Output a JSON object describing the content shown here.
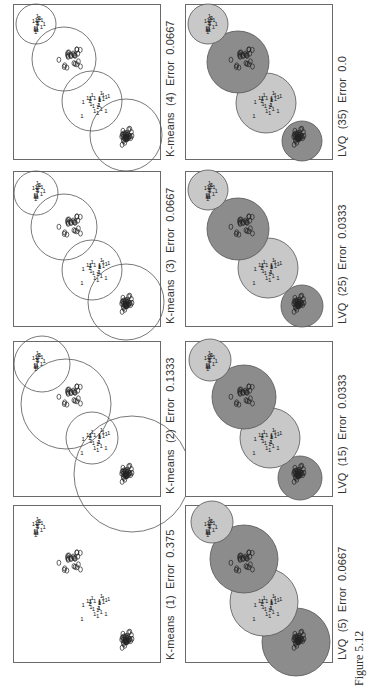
{
  "figure": {
    "label": "Figure 5.12"
  },
  "chart_data": [
    {
      "type": "scatter",
      "title": "K-means (1) Error 0.375",
      "method": "K-means",
      "iterations": 1,
      "error": "0.375",
      "classes": [
        "0",
        "1"
      ],
      "prototype_circles": 0,
      "filled": false
    },
    {
      "type": "scatter",
      "title": "K-means (2) Error 0.1333",
      "method": "K-means",
      "iterations": 2,
      "error": "0.1333",
      "classes": [
        "0",
        "1"
      ],
      "prototype_circles": 4,
      "filled": false
    },
    {
      "type": "scatter",
      "title": "K-means (3) Error 0.0667",
      "method": "K-means",
      "iterations": 3,
      "error": "0.0667",
      "classes": [
        "0",
        "1"
      ],
      "prototype_circles": 4,
      "filled": false
    },
    {
      "type": "scatter",
      "title": "K-means (4) Error 0.0667",
      "method": "K-means",
      "iterations": 4,
      "error": "0.0667",
      "classes": [
        "0",
        "1"
      ],
      "prototype_circles": 4,
      "filled": false
    },
    {
      "type": "scatter",
      "title": "LVQ (5) Error 0.0667",
      "method": "LVQ",
      "iterations": 5,
      "error": "0.0667",
      "classes": [
        "0",
        "1"
      ],
      "prototype_circles": 4,
      "filled": true
    },
    {
      "type": "scatter",
      "title": "LVQ (15) Error 0.0333",
      "method": "LVQ",
      "iterations": 15,
      "error": "0.0333",
      "classes": [
        "0",
        "1"
      ],
      "prototype_circles": 4,
      "filled": true
    },
    {
      "type": "scatter",
      "title": "LVQ (25) Error 0.0333",
      "method": "LVQ",
      "iterations": 25,
      "error": "0.0333",
      "classes": [
        "0",
        "1"
      ],
      "prototype_circles": 4,
      "filled": true
    },
    {
      "type": "scatter",
      "title": "LVQ (35) Error 0.0",
      "method": "LVQ",
      "iterations": 35,
      "error": "0.0",
      "classes": [
        "0",
        "1"
      ],
      "prototype_circles": 4,
      "filled": true
    }
  ],
  "panels": [
    {
      "caption": "K-means  (1)  Error  0.375"
    },
    {
      "caption": "K-means  (2)  Error  0.1333"
    },
    {
      "caption": "K-means  (3)  Error  0.0667"
    },
    {
      "caption": "K-means  (4)  Error  0.0667"
    },
    {
      "caption": "LVQ  (5)  Error  0.0667"
    },
    {
      "caption": "LVQ  (15)  Error  0.0333"
    },
    {
      "caption": "LVQ  (25)  Error  0.0333"
    },
    {
      "caption": "LVQ  (35)  Error  0.0"
    }
  ],
  "colors": {
    "dark_fill": "#8c8c8c",
    "light_fill": "#c8c8c8",
    "stroke": "#555555",
    "frame": "#6a6a6a"
  }
}
